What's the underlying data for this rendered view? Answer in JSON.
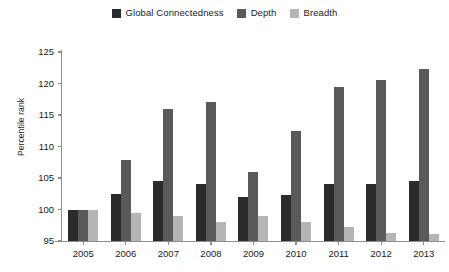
{
  "chart_data": {
    "type": "bar",
    "title": "",
    "subtitle": "",
    "xlabel": "",
    "ylabel": "Percentile rank",
    "categories": [
      "2005",
      "2006",
      "2007",
      "2008",
      "2009",
      "2010",
      "2011",
      "2012",
      "2013"
    ],
    "ylim": [
      95,
      125
    ],
    "ytick_values": [
      125,
      120,
      115,
      110,
      105,
      100,
      95
    ],
    "ytick_labels": [
      "125",
      "120",
      "115",
      "110",
      "105",
      "100",
      "95"
    ],
    "ytick_step": 5,
    "grid": false,
    "legend_position": "top-center",
    "series": [
      {
        "name": "Global Connectedness",
        "color": "#2b2b2b",
        "values": [
          100.0,
          102.5,
          104.5,
          104.0,
          102.0,
          102.3,
          104.0,
          104.0,
          104.5
        ]
      },
      {
        "name": "Depth",
        "color": "#5a5a5a",
        "values": [
          100.0,
          107.8,
          116.0,
          117.0,
          106.0,
          112.5,
          119.5,
          120.5,
          122.3
        ]
      },
      {
        "name": "Breadth",
        "color": "#b5b5b5",
        "values": [
          100.0,
          99.5,
          99.0,
          98.0,
          99.0,
          98.0,
          97.2,
          96.3,
          96.1
        ]
      }
    ],
    "axis_color": "#8e8e8e",
    "background_color": "#ffffff"
  }
}
